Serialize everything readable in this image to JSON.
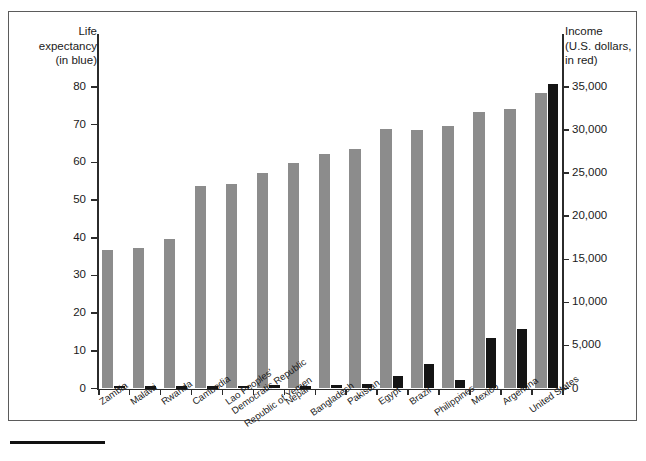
{
  "figure": {
    "left_axis_title": "Life\nexpectancy\n(in blue)",
    "right_axis_title": "Income\n(U.S. dollars,\nin red)"
  },
  "chart_data": {
    "type": "bar",
    "title": "",
    "subtitle": "",
    "xlabel": "",
    "ylabel": "Life expectancy (in blue)",
    "y2label": "Income (U.S. dollars, in red)",
    "grid": false,
    "legend_position": "axis-titles",
    "ylim": [
      0,
      80
    ],
    "y2lim": [
      0,
      35000
    ],
    "yticks": [
      0,
      10,
      20,
      30,
      40,
      50,
      60,
      70,
      80
    ],
    "ytick_labels": [
      "0",
      "10",
      "20",
      "30",
      "40",
      "50",
      "60",
      "70",
      "80"
    ],
    "y2ticks": [
      0,
      5000,
      10000,
      15000,
      20000,
      25000,
      30000,
      35000
    ],
    "y2tick_labels": [
      "0",
      "5,000",
      "10,000",
      "15,000",
      "20,000",
      "25,000",
      "30,000",
      "35,000"
    ],
    "categories": [
      "Zambia",
      "Malawi",
      "Rwanda",
      "Cambodia",
      "Lao Peoples' Democratic Republic",
      "Republic of Yemen",
      "Nepal",
      "Bangladesh",
      "Pakistan",
      "Egypt",
      "Brazil",
      "Philippines",
      "Mexico",
      "Argentina",
      "United States"
    ],
    "series": [
      {
        "name": "Life expectancy",
        "axis": "left",
        "color": "#8c8c8c",
        "units": "years",
        "values": [
          36.7,
          37.4,
          39.8,
          53.7,
          54.2,
          57.1,
          59.8,
          62.1,
          63.6,
          68.8,
          68.5,
          69.6,
          73.4,
          74.2,
          78.3
        ]
      },
      {
        "name": "Income",
        "axis": "right",
        "color": "#141414",
        "units": "U.S. dollars",
        "values": [
          330,
          190,
          250,
          280,
          330,
          460,
          230,
          380,
          470,
          1490,
          2850,
          1040,
          5910,
          6960,
          35400
        ]
      }
    ]
  }
}
